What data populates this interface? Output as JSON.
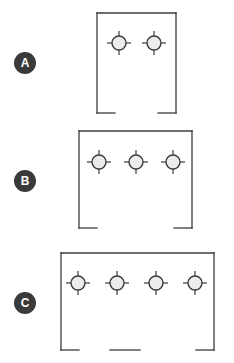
{
  "diagram": {
    "background_color": "#ffffff",
    "line_color": "#3c3c3c",
    "badge_color": "#3a3a3a",
    "badge_text_color": "#ffffff",
    "burner_fill_color": "#ececec",
    "options": [
      {
        "id": "option-a",
        "label": "A",
        "burner_count": 2,
        "box": {
          "x": 97,
          "y": 13,
          "width": 79,
          "height": 100
        },
        "burners_y": 43,
        "burner_x": [
          119,
          154
        ],
        "bottom_segments": [
          {
            "x1": 97,
            "x2": 115
          },
          {
            "x1": 158,
            "x2": 176
          }
        ],
        "badge": {
          "x": 14,
          "y": 52
        }
      },
      {
        "id": "option-b",
        "label": "B",
        "burner_count": 3,
        "box": {
          "x": 79,
          "y": 131,
          "width": 113,
          "height": 97
        },
        "burners_y": 162,
        "burner_x": [
          99,
          136,
          173
        ],
        "bottom_segments": [
          {
            "x1": 79,
            "x2": 97
          },
          {
            "x1": 174,
            "x2": 192
          }
        ],
        "badge": {
          "x": 14,
          "y": 170
        }
      },
      {
        "id": "option-c",
        "label": "C",
        "burner_count": 4,
        "box": {
          "x": 61,
          "y": 253,
          "width": 153,
          "height": 97
        },
        "burners_y": 283,
        "burner_x": [
          78,
          117,
          156,
          195
        ],
        "bottom_segments": [
          {
            "x1": 61,
            "x2": 79
          },
          {
            "x1": 110,
            "x2": 140
          },
          {
            "x1": 196,
            "x2": 214
          }
        ],
        "badge": {
          "x": 14,
          "y": 292
        }
      }
    ],
    "burner_symbol": {
      "name": "burner-icon",
      "circle_radius": 7,
      "tick_length": 5,
      "stroke_width": 1.2
    }
  }
}
